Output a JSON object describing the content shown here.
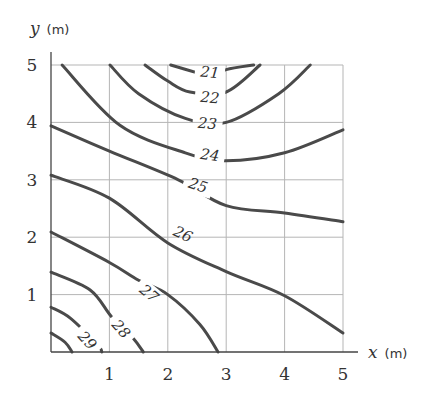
{
  "chart_data": {
    "type": "contour",
    "title": "",
    "xlabel": {
      "var": "x",
      "unit": "(m)"
    },
    "ylabel": {
      "var": "y",
      "unit": "(m)"
    },
    "xlim": [
      0,
      5
    ],
    "ylim": [
      0,
      5
    ],
    "grid": true,
    "x_ticks": [
      "1",
      "2",
      "3",
      "4",
      "5"
    ],
    "y_ticks": [
      "1",
      "2",
      "3",
      "4",
      "5"
    ],
    "contours": [
      {
        "level": "21",
        "label_pos": [
          2.72,
          4.87
        ],
        "label_rot": 5,
        "points": [
          [
            2.05,
            5.0
          ],
          [
            2.55,
            4.85
          ],
          [
            2.72,
            4.8
          ],
          [
            3.0,
            4.92
          ],
          [
            3.47,
            5.0
          ]
        ]
      },
      {
        "level": "22",
        "label_pos": [
          2.72,
          4.43
        ],
        "label_rot": 5,
        "points": [
          [
            1.61,
            5.0
          ],
          [
            2.0,
            4.72
          ],
          [
            2.38,
            4.53
          ],
          [
            3.0,
            4.53
          ],
          [
            3.58,
            5.0
          ]
        ]
      },
      {
        "level": "23",
        "label_pos": [
          2.68,
          3.98
        ],
        "label_rot": 5,
        "points": [
          [
            1.01,
            5.0
          ],
          [
            1.5,
            4.5
          ],
          [
            2.3,
            4.07
          ],
          [
            3.0,
            4.0
          ],
          [
            3.9,
            4.5
          ],
          [
            4.44,
            5.0
          ]
        ]
      },
      {
        "level": "24",
        "label_pos": [
          2.72,
          3.43
        ],
        "label_rot": 8,
        "points": [
          [
            0.19,
            5.0
          ],
          [
            1.18,
            3.95
          ],
          [
            2.3,
            3.47
          ],
          [
            3.0,
            3.33
          ],
          [
            4.0,
            3.47
          ],
          [
            5.0,
            3.87
          ]
        ]
      },
      {
        "level": "25",
        "label_pos": [
          2.52,
          2.9
        ],
        "label_rot": 18,
        "points": [
          [
            0.0,
            3.94
          ],
          [
            1.0,
            3.5
          ],
          [
            2.18,
            3.0
          ],
          [
            3.0,
            2.55
          ],
          [
            4.0,
            2.42
          ],
          [
            5.0,
            2.27
          ]
        ]
      },
      {
        "level": "26",
        "label_pos": [
          2.26,
          2.05
        ],
        "label_rot": 25,
        "points": [
          [
            0.0,
            3.08
          ],
          [
            1.0,
            2.68
          ],
          [
            2.0,
            1.9
          ],
          [
            3.0,
            1.4
          ],
          [
            4.0,
            0.98
          ],
          [
            5.0,
            0.33
          ]
        ]
      },
      {
        "level": "27",
        "label_pos": [
          1.68,
          1.02
        ],
        "label_rot": 40,
        "points": [
          [
            0.0,
            2.09
          ],
          [
            1.0,
            1.56
          ],
          [
            1.5,
            1.25
          ],
          [
            2.0,
            1.0
          ],
          [
            2.55,
            0.48
          ],
          [
            2.86,
            0.0
          ]
        ]
      },
      {
        "level": "28",
        "label_pos": [
          1.2,
          0.4
        ],
        "label_rot": 48,
        "points": [
          [
            0.0,
            1.39
          ],
          [
            0.67,
            1.08
          ],
          [
            1.04,
            0.61
          ],
          [
            1.4,
            0.25
          ],
          [
            1.58,
            0.0
          ]
        ]
      },
      {
        "level": "29",
        "label_pos": [
          0.62,
          0.2
        ],
        "label_rot": 48,
        "points": [
          [
            0.0,
            0.78
          ],
          [
            0.33,
            0.59
          ],
          [
            0.8,
            0.12
          ],
          [
            0.87,
            0.0
          ]
        ]
      },
      {
        "level": "",
        "label_pos": null,
        "label_rot": 0,
        "points": [
          [
            0.0,
            0.33
          ],
          [
            0.24,
            0.17
          ],
          [
            0.36,
            0.0
          ]
        ]
      }
    ]
  },
  "colors": {
    "contour": "#4a4a4a",
    "grid": "#b5b5b5",
    "axis": "#444444",
    "text": "#333333"
  }
}
